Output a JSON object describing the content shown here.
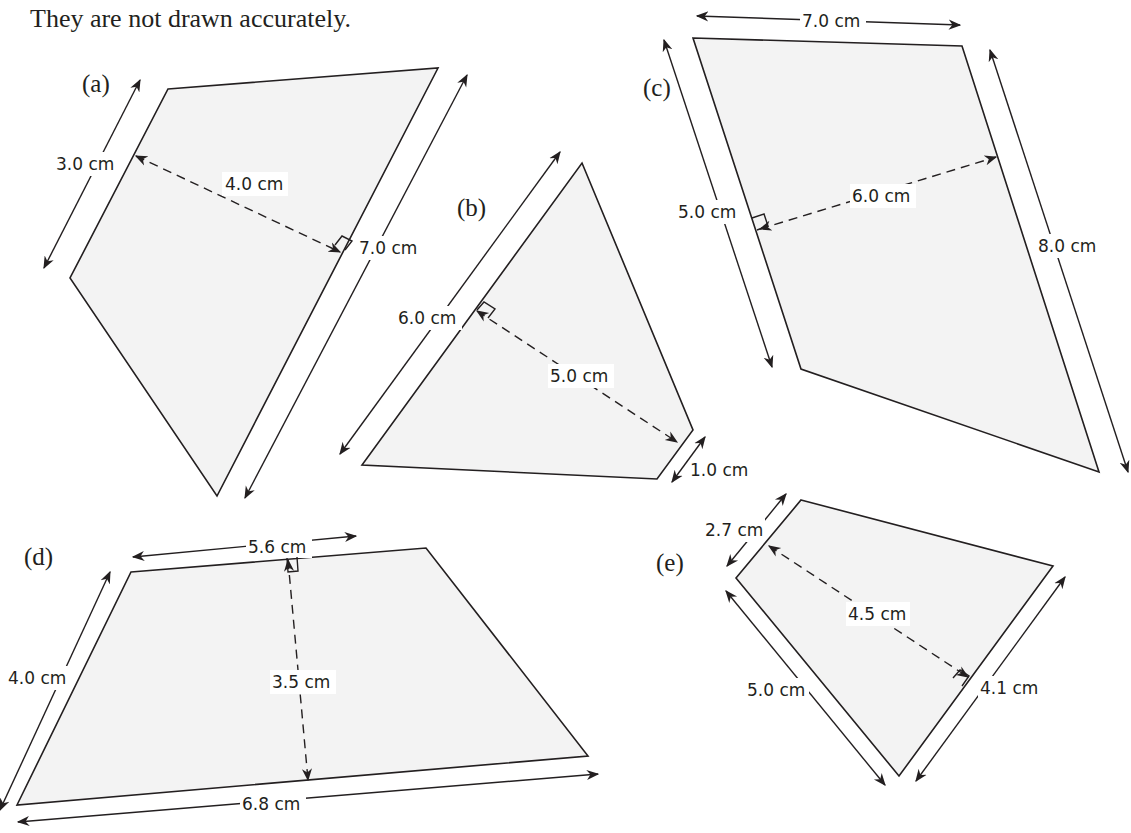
{
  "caption": "They are not drawn accurately.",
  "shapes": {
    "a": {
      "label": "(a)",
      "type": "trapezium",
      "parallel_side_1": "3.0 cm",
      "parallel_side_2": "7.0 cm",
      "height": "4.0 cm"
    },
    "b": {
      "label": "(b)",
      "type": "trapezium",
      "parallel_side_1": "6.0 cm",
      "parallel_side_2": "1.0 cm",
      "height": "5.0 cm"
    },
    "c": {
      "label": "(c)",
      "type": "trapezium",
      "top_side": "7.0 cm",
      "parallel_side_1": "5.0 cm",
      "parallel_side_2": "8.0 cm",
      "height": "6.0 cm"
    },
    "d": {
      "label": "(d)",
      "type": "trapezium",
      "slant_side": "4.0 cm",
      "parallel_side_1": "5.6 cm",
      "parallel_side_2": "6.8 cm",
      "height": "3.5 cm"
    },
    "e": {
      "label": "(e)",
      "type": "trapezium",
      "slant_side": "5.0 cm",
      "parallel_side_1": "2.7 cm",
      "parallel_side_2": "4.1 cm",
      "height": "4.5 cm"
    }
  }
}
